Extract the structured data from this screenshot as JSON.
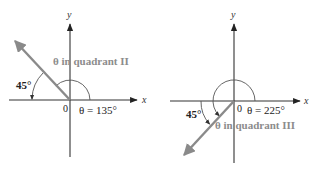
{
  "figures": [
    {
      "id": "quadrant-ii",
      "axis_labels": {
        "x": "x",
        "y": "y",
        "origin": "0"
      },
      "ray_label": "θ in quadrant II",
      "angle_label": "θ = 135°",
      "reference_angle_label": "45°",
      "theta_deg": 135,
      "reference_angle_deg": 45,
      "quadrant": "II"
    },
    {
      "id": "quadrant-iii",
      "axis_labels": {
        "x": "x",
        "y": "y",
        "origin": "0"
      },
      "ray_label": "θ in quadrant III",
      "angle_label": "θ = 225°",
      "reference_angle_label": "45°",
      "theta_deg": 225,
      "reference_angle_deg": 45,
      "quadrant": "III"
    }
  ],
  "colors": {
    "axis": "#333333",
    "ray": "#8a8a8a",
    "ray_label": "#8c8c8c",
    "text": "#222222"
  }
}
